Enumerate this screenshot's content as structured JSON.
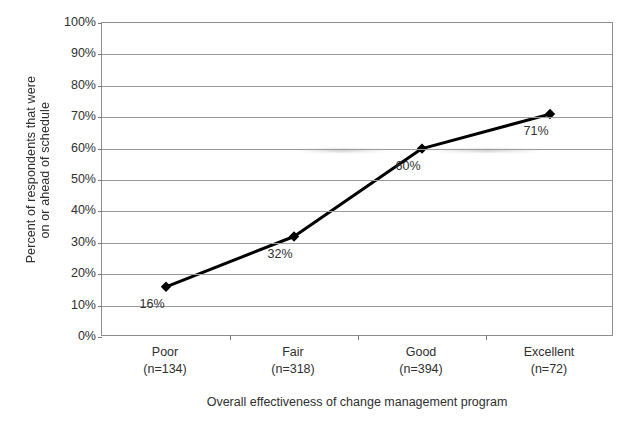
{
  "chart_data": {
    "type": "line",
    "title": "",
    "subtitle": "",
    "xlabel": "Overall effectiveness of change management program",
    "ylabel": "Percent of respondents that were on or ahead of schedule",
    "ylabel_lines": [
      "Percent of respondents that were",
      "on or ahead of schedule"
    ],
    "categories": [
      "Poor",
      "Fair",
      "Good",
      "Excellent"
    ],
    "category_counts": [
      "(n=134)",
      "(n=318)",
      "(n=394)",
      "(n=72)"
    ],
    "values": [
      16,
      32,
      60,
      71
    ],
    "point_labels": [
      "16%",
      "32%",
      "60%",
      "71%"
    ],
    "ylim": [
      0,
      100
    ],
    "ytick_values": [
      0,
      10,
      20,
      30,
      40,
      50,
      60,
      70,
      80,
      90,
      100
    ],
    "ytick_labels": [
      "0%",
      "10%",
      "20%",
      "30%",
      "40%",
      "50%",
      "60%",
      "70%",
      "80%",
      "90%",
      "100%"
    ],
    "grid": "horizontal",
    "legend": "none",
    "series": [
      {
        "name": "Percent on or ahead of schedule",
        "values": [
          16,
          32,
          60,
          71
        ],
        "marker": "diamond",
        "line_color": "#000000",
        "marker_color": "#000000"
      }
    ],
    "colors": {
      "line": "#000000",
      "marker": "#000000",
      "gridline": "#9a9a9a",
      "axis": "#8d8d8d",
      "text": "#2f2f2f",
      "background": "#ffffff"
    }
  }
}
